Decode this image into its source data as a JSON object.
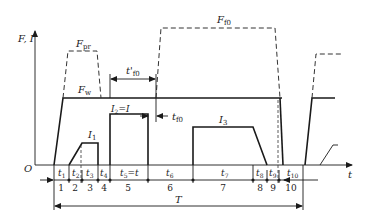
{
  "diagram": {
    "axes": {
      "y_label": "F, I",
      "x_label": "t",
      "origin_label": "O"
    },
    "curves": {
      "Fw": {
        "label": "F",
        "sub": "w",
        "style": "solid"
      },
      "Fpr": {
        "label": "F",
        "sub": "pr",
        "style": "dashed"
      },
      "Ff0": {
        "label": "F",
        "sub": "f0",
        "style": "dashed"
      },
      "I1": {
        "label": "I",
        "sub": "1"
      },
      "I2": {
        "label": "I",
        "sub": "2",
        "suffix": "=I"
      },
      "I3": {
        "label": "I",
        "sub": "3"
      }
    },
    "dimensions": {
      "t_prime_f0": {
        "label": "t'",
        "sub": "f0"
      },
      "t_f0": {
        "label": "t",
        "sub": "f0"
      },
      "T": {
        "label": "T"
      }
    },
    "intervals": [
      {
        "time": "t",
        "sub": "1",
        "num": "1"
      },
      {
        "time": "t",
        "sub": "2",
        "num": "2"
      },
      {
        "time": "t",
        "sub": "3",
        "num": "3"
      },
      {
        "time": "t",
        "sub": "4",
        "num": "4"
      },
      {
        "time": "t",
        "sub": "5",
        "suffix": "=t",
        "num": "5"
      },
      {
        "time": "t",
        "sub": "6",
        "num": "6"
      },
      {
        "time": "t",
        "sub": "7",
        "num": "7"
      },
      {
        "time": "t",
        "sub": "8",
        "num": "8"
      },
      {
        "time": "t",
        "sub": "9",
        "num": "9"
      },
      {
        "time": "t",
        "sub": "10",
        "num": "10"
      }
    ]
  }
}
